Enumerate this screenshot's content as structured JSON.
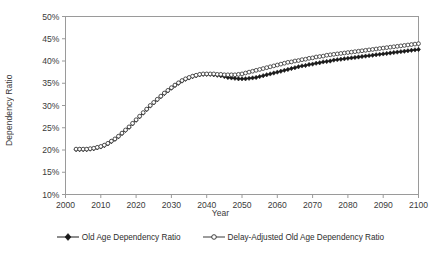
{
  "chart_data": {
    "type": "line",
    "title": "",
    "xlabel": "Year",
    "ylabel": "Dependency Ratio",
    "xlim": [
      2000,
      2100
    ],
    "ylim": [
      10,
      50
    ],
    "xticks": [
      "2000",
      "2010",
      "2020",
      "2030",
      "2040",
      "2050",
      "2060",
      "2070",
      "2080",
      "2090",
      "2100"
    ],
    "yticks": [
      "10%",
      "15%",
      "20%",
      "25%",
      "30%",
      "35%",
      "40%",
      "45%",
      "50%"
    ],
    "grid": false,
    "legend_position": "bottom",
    "x": [
      2003,
      2004,
      2005,
      2006,
      2007,
      2008,
      2009,
      2010,
      2011,
      2012,
      2013,
      2014,
      2015,
      2016,
      2017,
      2018,
      2019,
      2020,
      2021,
      2022,
      2023,
      2024,
      2025,
      2026,
      2027,
      2028,
      2029,
      2030,
      2031,
      2032,
      2033,
      2034,
      2035,
      2036,
      2037,
      2038,
      2039,
      2040,
      2041,
      2042,
      2043,
      2044,
      2045,
      2046,
      2047,
      2048,
      2049,
      2050,
      2051,
      2052,
      2053,
      2054,
      2055,
      2056,
      2057,
      2058,
      2059,
      2060,
      2061,
      2062,
      2063,
      2064,
      2065,
      2066,
      2067,
      2068,
      2069,
      2070,
      2071,
      2072,
      2073,
      2074,
      2075,
      2076,
      2077,
      2078,
      2079,
      2080,
      2081,
      2082,
      2083,
      2084,
      2085,
      2086,
      2087,
      2088,
      2089,
      2090,
      2091,
      2092,
      2093,
      2094,
      2095,
      2096,
      2097,
      2098,
      2099,
      2100
    ],
    "series": [
      {
        "name": "Old Age Dependency Ratio",
        "marker": "filled-diamond",
        "color": "#1a1a1a",
        "values": [
          20.1,
          20.1,
          20.1,
          20.1,
          20.2,
          20.3,
          20.5,
          20.7,
          21.0,
          21.4,
          21.9,
          22.4,
          23.0,
          23.7,
          24.4,
          25.1,
          25.9,
          26.7,
          27.5,
          28.3,
          29.1,
          29.9,
          30.6,
          31.3,
          32.0,
          32.7,
          33.3,
          33.9,
          34.5,
          35.0,
          35.5,
          35.9,
          36.2,
          36.5,
          36.7,
          36.9,
          37.0,
          37.0,
          37.0,
          36.9,
          36.8,
          36.7,
          36.5,
          36.3,
          36.2,
          36.1,
          36.0,
          36.0,
          36.0,
          36.1,
          36.2,
          36.3,
          36.5,
          36.7,
          36.9,
          37.1,
          37.3,
          37.5,
          37.7,
          37.9,
          38.1,
          38.3,
          38.5,
          38.7,
          38.9,
          39.0,
          39.2,
          39.3,
          39.5,
          39.6,
          39.8,
          39.9,
          40.0,
          40.2,
          40.3,
          40.4,
          40.5,
          40.6,
          40.7,
          40.8,
          40.9,
          41.0,
          41.1,
          41.2,
          41.3,
          41.4,
          41.5,
          41.6,
          41.7,
          41.8,
          41.9,
          42.0,
          42.1,
          42.2,
          42.3,
          42.4,
          42.5,
          42.6
        ]
      },
      {
        "name": "Delay-Adjusted Old Age Dependency Ratio",
        "marker": "open-circle",
        "color": "#3a3a3a",
        "values": [
          20.2,
          20.2,
          20.2,
          20.2,
          20.3,
          20.4,
          20.6,
          20.8,
          21.1,
          21.5,
          22.0,
          22.5,
          23.1,
          23.8,
          24.5,
          25.2,
          26.0,
          26.8,
          27.6,
          28.4,
          29.2,
          30.0,
          30.7,
          31.4,
          32.1,
          32.8,
          33.4,
          34.0,
          34.6,
          35.1,
          35.6,
          36.0,
          36.3,
          36.6,
          36.8,
          37.0,
          37.1,
          37.1,
          37.1,
          37.1,
          37.0,
          37.0,
          36.9,
          36.9,
          36.9,
          36.9,
          37.0,
          37.1,
          37.3,
          37.5,
          37.7,
          37.9,
          38.1,
          38.3,
          38.5,
          38.7,
          38.9,
          39.1,
          39.3,
          39.5,
          39.7,
          39.8,
          40.0,
          40.1,
          40.3,
          40.4,
          40.6,
          40.7,
          40.9,
          41.0,
          41.1,
          41.3,
          41.4,
          41.5,
          41.6,
          41.7,
          41.8,
          41.9,
          42.0,
          42.1,
          42.2,
          42.3,
          42.4,
          42.5,
          42.6,
          42.7,
          42.8,
          42.9,
          43.0,
          43.1,
          43.2,
          43.3,
          43.4,
          43.5,
          43.6,
          43.7,
          43.8,
          43.9
        ]
      }
    ]
  },
  "legend": {
    "items": [
      {
        "label": "Old Age Dependency Ratio"
      },
      {
        "label": "Delay-Adjusted Old Age Dependency Ratio"
      }
    ]
  }
}
